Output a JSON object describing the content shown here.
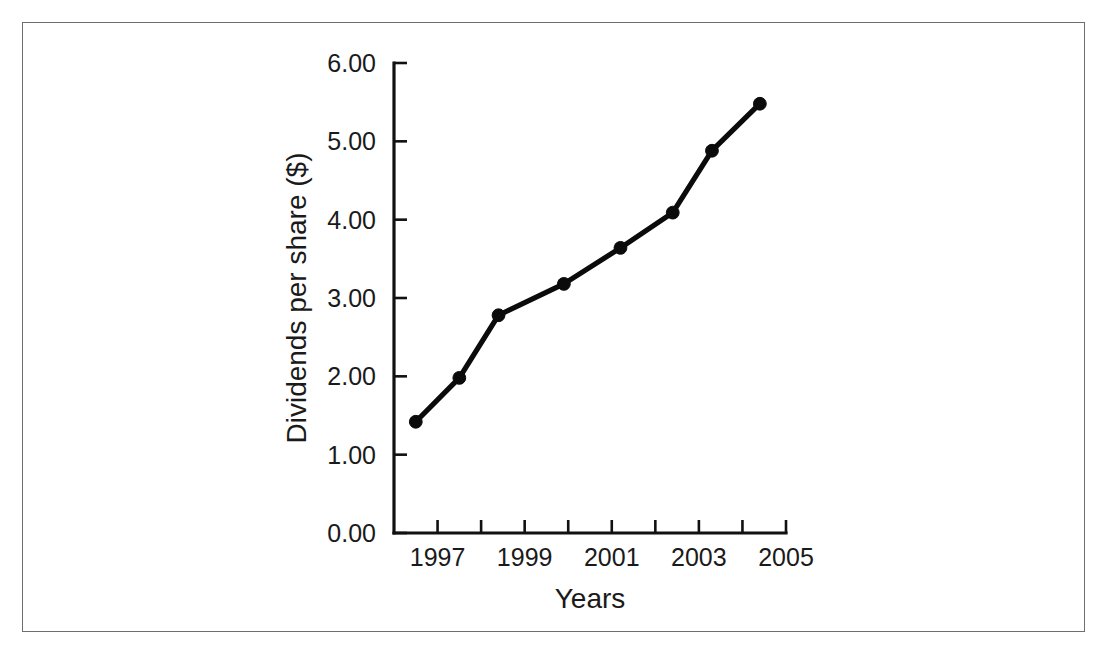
{
  "figure": {
    "frame_color": "#6e6e6e",
    "background": "#ffffff",
    "ink_color": "#0b0b0b"
  },
  "chart_data": {
    "type": "line",
    "title": "",
    "xlabel": "Years",
    "ylabel": "Dividends per share ($)",
    "xlim": [
      1996,
      2005
    ],
    "ylim": [
      0,
      6
    ],
    "grid": false,
    "legend": false,
    "marker": "filled-circle",
    "x_tick_values": [
      1996,
      1997,
      1998,
      1999,
      2000,
      2001,
      2002,
      2003,
      2004,
      2005
    ],
    "x_tick_labels": [
      "",
      "1997",
      "",
      "1999",
      "",
      "2001",
      "",
      "2003",
      "",
      "2005"
    ],
    "y_tick_values": [
      0,
      1,
      2,
      3,
      4,
      5,
      6
    ],
    "y_tick_labels": [
      "0.00",
      "1.00",
      "2.00",
      "3.00",
      "4.00",
      "5.00",
      "6.00"
    ],
    "series": [
      {
        "name": "Dividends per share",
        "x": [
          1996.5,
          1997.5,
          1998.4,
          1999.9,
          2001.2,
          2002.4,
          2003.3,
          2004.4
        ],
        "values": [
          1.42,
          1.98,
          2.78,
          3.18,
          3.64,
          4.09,
          4.88,
          5.48
        ]
      }
    ]
  }
}
